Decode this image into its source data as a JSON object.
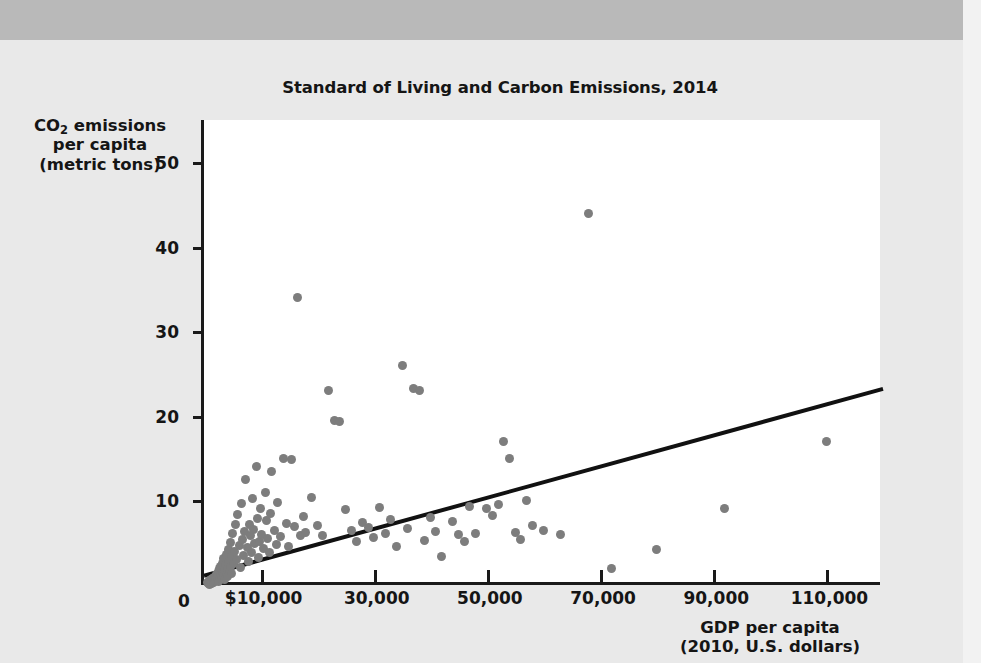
{
  "chart_data": {
    "type": "scatter",
    "title": "Standard of Living and Carbon Emissions, 2014",
    "xlabel": "GDP per capita",
    "xlabel_line2": "(2010, U.S. dollars)",
    "ylabel": "CO",
    "ylabel_sub": "2",
    "ylabel_rest": " emissions",
    "ylabel_line2": "per capita",
    "ylabel_line3": "(metric tons)",
    "xlim": [
      0,
      120000
    ],
    "ylim": [
      0,
      55
    ],
    "grid": false,
    "legend": null,
    "x_ticks": [
      0,
      10000,
      30000,
      50000,
      70000,
      90000,
      110000
    ],
    "x_tick_labels": [
      "0",
      "$10,000",
      "30,000",
      "50,000",
      "70,000",
      "90,000",
      "110,000"
    ],
    "y_ticks": [
      0,
      10,
      20,
      30,
      40,
      50
    ],
    "y_tick_labels": [
      "0",
      "10",
      "20",
      "30",
      "40",
      "50"
    ],
    "dot_color": "#7d7d7d",
    "line_color": "#111111",
    "trendline": {
      "x0": 0,
      "y0": 1.1,
      "x1": 120000,
      "y1": 23.2
    },
    "points": [
      [
        600,
        0.3
      ],
      [
        800,
        0.2
      ],
      [
        900,
        0.5
      ],
      [
        1000,
        0.1
      ],
      [
        1100,
        0.4
      ],
      [
        1200,
        0.3
      ],
      [
        1300,
        0.6
      ],
      [
        1400,
        0.2
      ],
      [
        1500,
        0.8
      ],
      [
        1600,
        0.4
      ],
      [
        1700,
        0.3
      ],
      [
        1800,
        0.9
      ],
      [
        1900,
        0.5
      ],
      [
        2000,
        1.0
      ],
      [
        2100,
        0.6
      ],
      [
        2200,
        1.3
      ],
      [
        2300,
        0.7
      ],
      [
        2400,
        1.1
      ],
      [
        2500,
        0.4
      ],
      [
        2600,
        1.6
      ],
      [
        2700,
        0.8
      ],
      [
        2800,
        1.9
      ],
      [
        2900,
        1.2
      ],
      [
        3000,
        2.2
      ],
      [
        3100,
        0.9
      ],
      [
        3200,
        1.5
      ],
      [
        3300,
        2.6
      ],
      [
        3400,
        1.1
      ],
      [
        3500,
        3.1
      ],
      [
        3600,
        1.8
      ],
      [
        3700,
        0.7
      ],
      [
        3800,
        2.4
      ],
      [
        3900,
        1.3
      ],
      [
        4000,
        3.6
      ],
      [
        4100,
        2.0
      ],
      [
        4200,
        1.0
      ],
      [
        4300,
        4.2
      ],
      [
        4400,
        2.8
      ],
      [
        4500,
        1.6
      ],
      [
        4600,
        5.0
      ],
      [
        4700,
        2.2
      ],
      [
        4800,
        3.4
      ],
      [
        4900,
        1.4
      ],
      [
        5000,
        6.1
      ],
      [
        5200,
        2.6
      ],
      [
        5400,
        4.0
      ],
      [
        5600,
        7.2
      ],
      [
        5800,
        3.0
      ],
      [
        6000,
        8.3
      ],
      [
        6200,
        4.7
      ],
      [
        6400,
        2.1
      ],
      [
        6600,
        9.6
      ],
      [
        6800,
        5.4
      ],
      [
        7000,
        3.5
      ],
      [
        7200,
        6.3
      ],
      [
        7400,
        12.5
      ],
      [
        7600,
        4.4
      ],
      [
        7800,
        2.8
      ],
      [
        8000,
        7.1
      ],
      [
        8200,
        5.9
      ],
      [
        8400,
        3.8
      ],
      [
        8600,
        10.2
      ],
      [
        8800,
        6.6
      ],
      [
        9000,
        4.9
      ],
      [
        9200,
        14.0
      ],
      [
        9400,
        7.9
      ],
      [
        9600,
        3.3
      ],
      [
        9800,
        5.2
      ],
      [
        10000,
        9.1
      ],
      [
        10200,
        6.0
      ],
      [
        10500,
        4.3
      ],
      [
        10800,
        11.0
      ],
      [
        11000,
        7.6
      ],
      [
        11200,
        5.5
      ],
      [
        11500,
        3.9
      ],
      [
        11800,
        8.4
      ],
      [
        12000,
        13.4
      ],
      [
        12400,
        6.4
      ],
      [
        12800,
        4.8
      ],
      [
        13000,
        9.8
      ],
      [
        13500,
        5.7
      ],
      [
        14000,
        15.0
      ],
      [
        14500,
        7.3
      ],
      [
        15000,
        4.6
      ],
      [
        15500,
        14.8
      ],
      [
        16000,
        6.9
      ],
      [
        16500,
        34.0
      ],
      [
        17000,
        5.8
      ],
      [
        17500,
        8.1
      ],
      [
        18000,
        6.2
      ],
      [
        19000,
        10.4
      ],
      [
        20000,
        7.0
      ],
      [
        21000,
        5.9
      ],
      [
        22000,
        23.0
      ],
      [
        23000,
        19.5
      ],
      [
        24000,
        19.3
      ],
      [
        25000,
        8.9
      ],
      [
        26000,
        6.5
      ],
      [
        27000,
        5.1
      ],
      [
        28000,
        7.4
      ],
      [
        29000,
        6.8
      ],
      [
        30000,
        5.6
      ],
      [
        31000,
        9.2
      ],
      [
        32000,
        6.1
      ],
      [
        33000,
        7.8
      ],
      [
        34000,
        4.5
      ],
      [
        35000,
        26.0
      ],
      [
        36000,
        6.7
      ],
      [
        37000,
        23.2
      ],
      [
        38000,
        23.0
      ],
      [
        39000,
        5.3
      ],
      [
        40000,
        8.0
      ],
      [
        41000,
        6.3
      ],
      [
        42000,
        3.4
      ],
      [
        44000,
        7.5
      ],
      [
        45000,
        6.0
      ],
      [
        46000,
        5.2
      ],
      [
        47000,
        9.3
      ],
      [
        48000,
        6.1
      ],
      [
        50000,
        9.0
      ],
      [
        51000,
        8.2
      ],
      [
        52000,
        9.5
      ],
      [
        53000,
        17.0
      ],
      [
        54000,
        15.0
      ],
      [
        55000,
        6.2
      ],
      [
        56000,
        5.4
      ],
      [
        57000,
        10.0
      ],
      [
        58000,
        7.0
      ],
      [
        60000,
        6.4
      ],
      [
        63000,
        6.0
      ],
      [
        68000,
        44.0
      ],
      [
        72000,
        2.0
      ],
      [
        80000,
        4.2
      ],
      [
        92000,
        9.0
      ],
      [
        110000,
        17.0
      ]
    ]
  }
}
